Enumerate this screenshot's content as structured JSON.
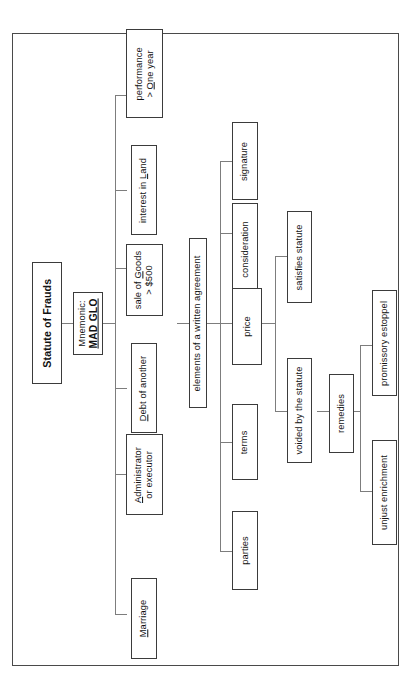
{
  "document": {
    "type": "tree-diagram",
    "orientation": "rotated-90-counterclockwise",
    "title": "Statute of Frauds",
    "mnemonic_label": "Mnemonic:",
    "mnemonic_value": "MAD GLO"
  },
  "nodes": {
    "root": "Statute of Frauds",
    "mnemonic_line1": "Mnemonic:",
    "mnemonic_line2": "MAD GLO",
    "marriage": "Marriage",
    "administrator_line1": "Administrator",
    "administrator_line2": "or executor",
    "debt": "Debt of another",
    "goods_line1": "sale of Goods",
    "goods_line2": "> $500",
    "land": "interest in Land",
    "performance_line1": "performance",
    "performance_line2": "> One year",
    "elements": "elements of a written agreement",
    "parties": "parties",
    "terms": "terms",
    "price": "price",
    "consideration": "consideration",
    "signature": "signature",
    "satisfies": "satisfies statute",
    "voided": "voided by the statute",
    "remedies": "remedies",
    "unjust": "unjust enrichment",
    "promissory": "promissory estoppel"
  },
  "mnemonic_letters": {
    "M": "Marriage",
    "A": "Administrator or executor",
    "D": "Debt of another",
    "G": "sale of Goods > $500",
    "L": "interest in Land",
    "O": "performance > One year"
  },
  "structure": [
    {
      "label": "Statute of Frauds",
      "children": [
        {
          "label": "Mnemonic: MAD GLO",
          "children": [
            {
              "label": "Marriage"
            },
            {
              "label": "Administrator or executor"
            },
            {
              "label": "Debt of another"
            },
            {
              "label": "sale of Goods > $500"
            },
            {
              "label": "interest in Land"
            },
            {
              "label": "performance > One year"
            }
          ]
        },
        {
          "label": "elements of a written agreement",
          "children": [
            {
              "label": "parties"
            },
            {
              "label": "terms"
            },
            {
              "label": "price",
              "children": [
                {
                  "label": "consideration"
                },
                {
                  "label": "signature"
                },
                {
                  "label": "satisfies statute"
                },
                {
                  "label": "voided by the statute",
                  "children": [
                    {
                      "label": "remedies",
                      "children": [
                        {
                          "label": "unjust enrichment"
                        },
                        {
                          "label": "promissory estoppel"
                        }
                      ]
                    }
                  ]
                }
              ]
            }
          ]
        }
      ]
    }
  ],
  "colors": {
    "border": "#3b3b3b",
    "page_border": "#4a4a4a",
    "connector": "#7d7d7d",
    "text": "#121212",
    "background": "#ffffff"
  }
}
